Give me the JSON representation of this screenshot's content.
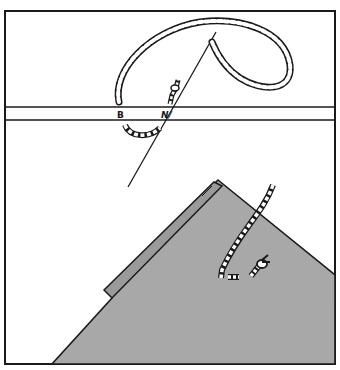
{
  "figure": {
    "colors": {
      "background": "#ffffff",
      "ink": "#1a1a1a",
      "fabric": "#a8a8a8",
      "fabric_fold": "#9a9a9a"
    },
    "panels": [
      {
        "name": "top-panel",
        "content": "thread loop with needle passing through a horizontal strip"
      },
      {
        "name": "bottom-panel",
        "content": "gray fabric corner with folded hem edge and thread knot"
      }
    ],
    "strip_labels": [
      "B",
      "N/"
    ]
  }
}
